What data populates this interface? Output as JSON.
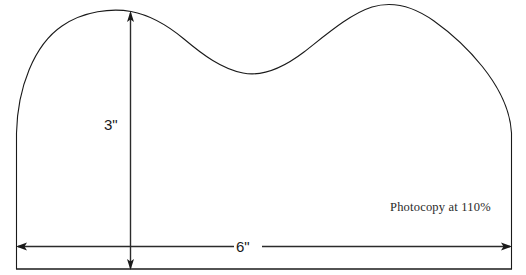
{
  "drawing": {
    "title": "Scalloped arch template pattern",
    "type": "technical-pattern-drawing",
    "background_color": "#ffffff",
    "line_color": "#1a1a1a",
    "dimensions": {
      "vertical": {
        "label": "3\"",
        "name": "height-dimension",
        "arrow_style": "double-headed",
        "orientation": "vertical"
      },
      "horizontal": {
        "label": "6\"",
        "name": "width-dimension",
        "arrow_style": "double-headed",
        "orientation": "horizontal"
      }
    },
    "note": {
      "text": "Photocopy at 110%"
    }
  }
}
